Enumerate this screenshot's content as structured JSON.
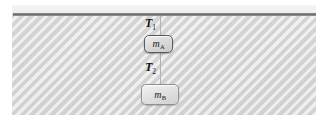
{
  "figure": {
    "background_color": "#dcdcdc",
    "panel_highlight_color": "#f0f0f0",
    "ceiling_color": "#6f6f6f",
    "string_color": "#b2b2b2"
  },
  "ceiling": {
    "name": "ceiling"
  },
  "strings": {
    "upper": {
      "name": "string-upper"
    },
    "middle": {
      "name": "string-middle"
    }
  },
  "labels": {
    "tension_1": {
      "symbol": "T",
      "subscript": "1",
      "full": "T1"
    },
    "tension_2": {
      "symbol": "T",
      "subscript": "2",
      "full": "T2"
    }
  },
  "blocks": [
    {
      "id": "block-a",
      "symbol": "m",
      "subscript": "A",
      "full": "mA",
      "border_color": "#5a5a5a",
      "fill_color": "#dcdcdc"
    },
    {
      "id": "block-b",
      "symbol": "m",
      "subscript": "B",
      "full": "mB",
      "border_color": "#909090",
      "fill_color": "#e2e2e2"
    }
  ]
}
